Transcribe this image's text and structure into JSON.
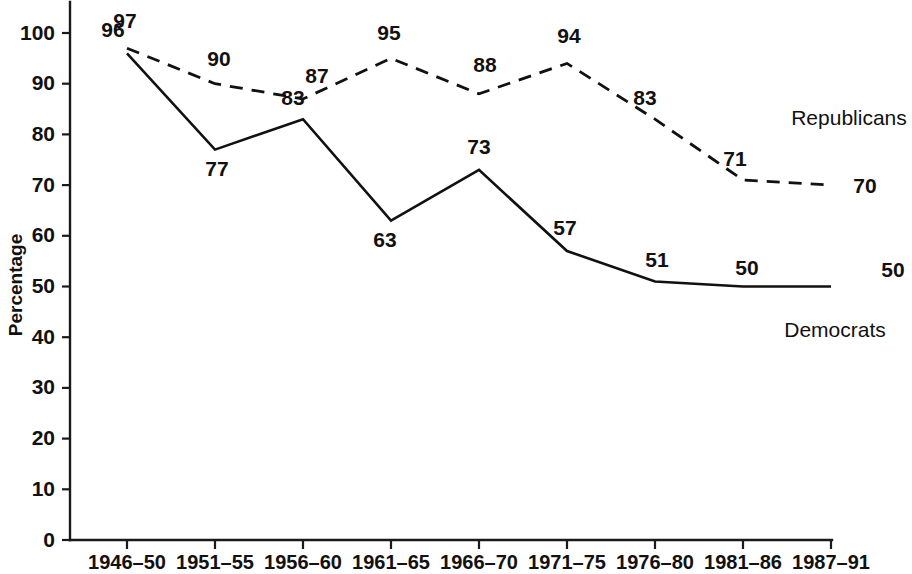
{
  "chart_data": {
    "type": "line",
    "title": "",
    "xlabel": "",
    "ylabel": "Percentage",
    "ylim": [
      0,
      100
    ],
    "yticks": [
      0,
      10,
      20,
      30,
      40,
      50,
      60,
      70,
      80,
      90,
      100
    ],
    "grid": false,
    "legend_position": "inline-right",
    "categories": [
      "1946–50",
      "1951–55",
      "1956–60",
      "1961–65",
      "1966–70",
      "1971–75",
      "1976–80",
      "1981–86",
      "1987–91"
    ],
    "series": [
      {
        "name": "Republicans",
        "style": "dashed",
        "values": [
          97,
          90,
          87,
          95,
          88,
          94,
          83,
          71,
          70
        ]
      },
      {
        "name": "Democrats",
        "style": "solid",
        "values": [
          96,
          77,
          83,
          63,
          73,
          57,
          51,
          50,
          50
        ]
      }
    ],
    "colors": {
      "line": "#111111",
      "axis": "#1a1a1a",
      "background": "#ffffff"
    }
  },
  "axis": {
    "y_title": "Percentage",
    "y_tick_labels": [
      "0",
      "10",
      "20",
      "30",
      "40",
      "50",
      "60",
      "70",
      "80",
      "90",
      "100"
    ],
    "x_tick_labels": [
      "1946–50",
      "1951–55",
      "1956–60",
      "1961–65",
      "1966–70",
      "1971–75",
      "1976–80",
      "1981–86",
      "1987–91"
    ]
  },
  "labels": {
    "republicans": [
      "97",
      "90",
      "87",
      "95",
      "88",
      "94",
      "83",
      "71",
      "70"
    ],
    "democrats": [
      "96",
      "77",
      "83",
      "63",
      "73",
      "57",
      "51",
      "50",
      "50"
    ],
    "series_names": {
      "republicans": "Republicans",
      "democrats": "Democrats"
    }
  }
}
